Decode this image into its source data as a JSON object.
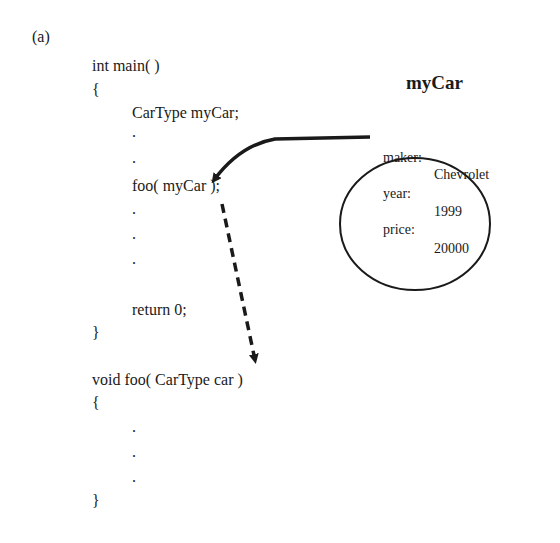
{
  "figure_label": "(a)",
  "code": {
    "main_signature": "int main( )",
    "main_open_brace": "{",
    "declaration": "CarType myCar;",
    "dot1": ".",
    "dot2": ".",
    "call": "foo( myCar );",
    "dot3": ".",
    "dot4": ".",
    "dot5": ".",
    "return_stmt": "return 0;",
    "main_close_brace": "}",
    "foo_signature": "void foo( CarType car )",
    "foo_open_brace": "{",
    "foo_dot1": ".",
    "foo_dot2": ".",
    "foo_dot3": ".",
    "foo_close_brace": "}"
  },
  "object": {
    "title": "myCar",
    "fields": [
      {
        "name": "maker:",
        "value": "Chevrolet"
      },
      {
        "name": "year:",
        "value": "1999"
      },
      {
        "name": "price:",
        "value": "20000"
      }
    ]
  },
  "arrows": {
    "reference_arrow": "solid curved arrow from myCar object to argument myCar",
    "copy_arrow": "dashed arrow from call to foo parameter"
  }
}
